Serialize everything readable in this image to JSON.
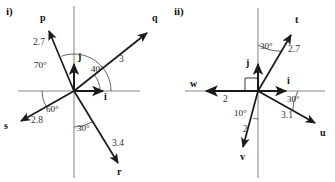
{
  "figure": {
    "background_color": "#ffffff",
    "axis_color": "#8a8a8a",
    "vector_color": "#1a1a1a",
    "arc_color": "#555555"
  },
  "panels": [
    {
      "id": "i",
      "part_label": "i)",
      "origin": {
        "x": 74,
        "y": 91
      },
      "axes": {
        "x_axis": {
          "x1": 18,
          "y1": 91,
          "x2": 140,
          "y2": 91
        },
        "y_axis": {
          "x1": 74,
          "y1": 6,
          "x2": 74,
          "y2": 178
        }
      },
      "unit_vectors": [
        {
          "name": "i",
          "label": "i",
          "tip": {
            "x": 105,
            "y": 91
          },
          "label_pos": {
            "x": 105,
            "y": 95
          }
        },
        {
          "name": "j",
          "label": "j",
          "tip": {
            "x": 74,
            "y": 62
          },
          "label_pos": {
            "x": 78,
            "y": 56
          }
        }
      ],
      "vectors": [
        {
          "name": "p",
          "label": "p",
          "magnitude": "2.7",
          "angle_deg": 110,
          "tip": {
            "x": 47,
            "y": 28
          },
          "label_pos": {
            "x": 40,
            "y": 17
          },
          "mag_pos": {
            "x": 38,
            "y": 42
          }
        },
        {
          "name": "q",
          "label": "q",
          "magnitude": "3",
          "angle_deg": 40,
          "tip": {
            "x": 150,
            "y": 30
          },
          "label_pos": {
            "x": 153,
            "y": 17
          },
          "mag_pos": {
            "x": 120,
            "y": 58
          }
        },
        {
          "name": "s",
          "label": "s",
          "magnitude": "2.8",
          "angle_deg": 210,
          "tip": {
            "x": 17,
            "y": 122
          },
          "label_pos": {
            "x": 5,
            "y": 122
          },
          "mag_pos": {
            "x": 33,
            "y": 119
          }
        },
        {
          "name": "r",
          "label": "r",
          "magnitude": "3.4",
          "angle_deg": -60,
          "tip": {
            "x": 120,
            "y": 167
          },
          "label_pos": {
            "x": 118,
            "y": 170
          },
          "mag_pos": {
            "x": 113,
            "y": 142
          }
        }
      ],
      "angle_labels": [
        {
          "text": "70°",
          "pos": {
            "x": 37,
            "y": 64
          },
          "arc": {
            "r": 37,
            "start_deg": 0,
            "end_deg": 110
          }
        },
        {
          "text": "40°",
          "pos": {
            "x": 93,
            "y": 68
          },
          "arc": {
            "r": 26,
            "start_deg": 0,
            "end_deg": 40
          }
        },
        {
          "text": "60°",
          "pos": {
            "x": 49,
            "y": 108
          },
          "arc": {
            "r": 32,
            "start_deg": 180,
            "end_deg": 210
          }
        },
        {
          "text": "30°",
          "pos": {
            "x": 80,
            "y": 126
          },
          "arc": {
            "r": 36,
            "start_deg": 270,
            "end_deg": 300
          }
        }
      ]
    },
    {
      "id": "ii",
      "part_label": "ii)",
      "origin": {
        "x": 258,
        "y": 91
      },
      "axes": {
        "x_axis": {
          "x1": 185,
          "y1": 91,
          "x2": 325,
          "y2": 91
        },
        "y_axis": {
          "x1": 258,
          "y1": 8,
          "x2": 258,
          "y2": 178
        }
      },
      "unit_vectors": [
        {
          "name": "i",
          "label": "i",
          "tip": {
            "x": 288,
            "y": 91
          },
          "label_pos": {
            "x": 288,
            "y": 79
          }
        },
        {
          "name": "j",
          "label": "j",
          "tip": {
            "x": 258,
            "y": 62
          },
          "label_pos": {
            "x": 248,
            "y": 62
          }
        }
      ],
      "vectors": [
        {
          "name": "t",
          "label": "t",
          "magnitude": "2.7",
          "angle_deg": 60,
          "tip": {
            "x": 293,
            "y": 32
          },
          "label_pos": {
            "x": 296,
            "y": 18
          },
          "mag_pos": {
            "x": 287,
            "y": 48
          }
        },
        {
          "name": "u",
          "label": "u",
          "magnitude": "3.1",
          "angle_deg": -30,
          "tip": {
            "x": 318,
            "y": 126
          },
          "label_pos": {
            "x": 321,
            "y": 130
          },
          "mag_pos": {
            "x": 281,
            "y": 115
          }
        },
        {
          "name": "v",
          "label": "v",
          "magnitude": "2",
          "angle_deg": -100,
          "tip": {
            "x": 242,
            "y": 150
          },
          "label_pos": {
            "x": 240,
            "y": 154
          },
          "mag_pos": {
            "x": 243,
            "y": 128
          }
        },
        {
          "name": "w",
          "label": "w",
          "magnitude": "2",
          "angle_deg": 180,
          "tip": {
            "x": 204,
            "y": 91
          },
          "label_pos": {
            "x": 190,
            "y": 81
          },
          "mag_pos": {
            "x": 223,
            "y": 97
          }
        }
      ],
      "angle_labels": [
        {
          "text": "30°",
          "pos": {
            "x": 259,
            "y": 45
          },
          "arc": {
            "r": 46,
            "start_deg": 60,
            "end_deg": 90
          }
        },
        {
          "text": "30°",
          "pos": {
            "x": 288,
            "y": 97
          },
          "arc": {
            "r": 40,
            "start_deg": -30,
            "end_deg": 0
          }
        },
        {
          "text": "10°",
          "pos": {
            "x": 236,
            "y": 112
          },
          "arc": {
            "r": 28,
            "start_deg": -100,
            "end_deg": -90
          }
        }
      ],
      "right_angle_marker": {
        "description": "right-angle square between j and w",
        "x": 238,
        "y": 71,
        "size": 13
      }
    }
  ]
}
